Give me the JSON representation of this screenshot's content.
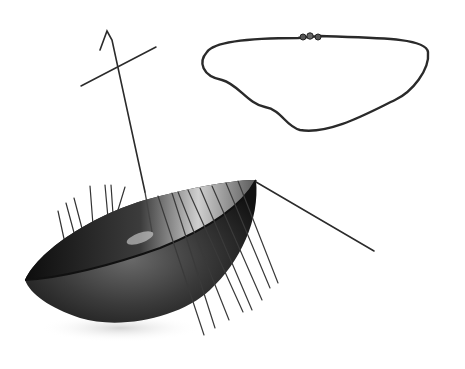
{
  "image": {
    "kind": "black-and-white photograph",
    "subject": "model boat-shaped bowl with wire oars and mast, and a chain necklace",
    "background": "#ffffff",
    "colors": {
      "dark": "#1a1a1a",
      "mid": "#4a4a4a",
      "light": "#9a9a9a",
      "wire": "#2b2b2b"
    },
    "objects": [
      {
        "name": "boat-hull",
        "description": "dark metallic bowl-shaped boat hull"
      },
      {
        "name": "mast",
        "description": "thin wire mast with hooked top and crossbar yard"
      },
      {
        "name": "oars",
        "description": "row of thin wire oars on both sides of the hull"
      },
      {
        "name": "steering-oar",
        "description": "long wire steering oar at stern"
      },
      {
        "name": "chain-necklace",
        "description": "fine chain necklace with clasp beads at top"
      }
    ]
  }
}
